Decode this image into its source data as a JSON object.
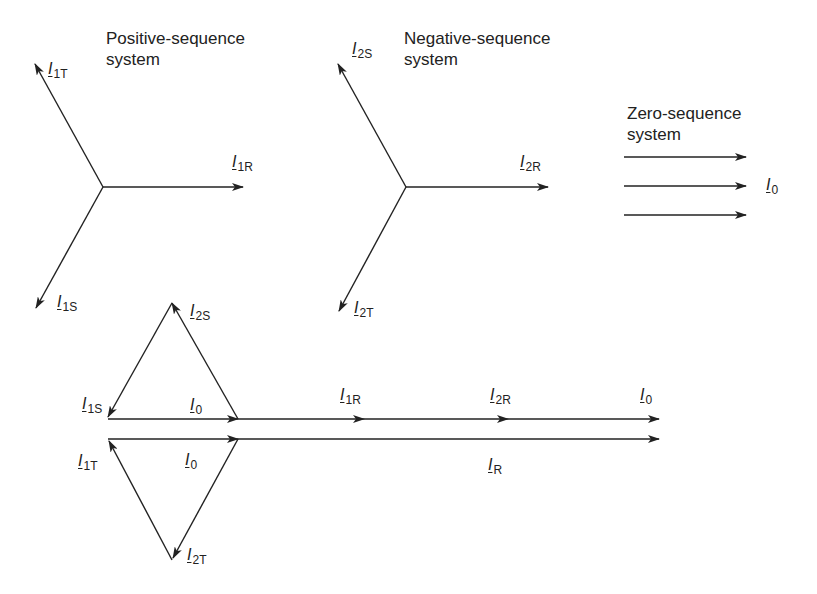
{
  "figure": {
    "captions": {
      "positive": "Positive-sequence\nsystem",
      "negative": "Negative-sequence\nsystem",
      "zero": "Zero-sequence\nsystem"
    },
    "positive_sequence": {
      "phasors": [
        {
          "id": "I1R",
          "symbol": "I",
          "subscript": "1R"
        },
        {
          "id": "I1S",
          "symbol": "I",
          "subscript": "1S"
        },
        {
          "id": "I1T",
          "symbol": "I",
          "subscript": "1T"
        }
      ]
    },
    "negative_sequence": {
      "phasors": [
        {
          "id": "I2R",
          "symbol": "I",
          "subscript": "2R"
        },
        {
          "id": "I2S",
          "symbol": "I",
          "subscript": "2S"
        },
        {
          "id": "I2T",
          "symbol": "I",
          "subscript": "2T"
        }
      ]
    },
    "zero_sequence": {
      "phasor": {
        "id": "I0",
        "symbol": "I",
        "subscript": "0"
      },
      "arrow_count": 3
    },
    "composite": {
      "upper_path_labels": [
        {
          "symbol": "I",
          "subscript": "1S"
        },
        {
          "symbol": "I",
          "subscript": "2S"
        },
        {
          "symbol": "I",
          "subscript": "0"
        },
        {
          "symbol": "I",
          "subscript": "1R"
        },
        {
          "symbol": "I",
          "subscript": "2R"
        },
        {
          "symbol": "I",
          "subscript": "0"
        }
      ],
      "lower_path_labels": [
        {
          "symbol": "I",
          "subscript": "1T"
        },
        {
          "symbol": "I",
          "subscript": "2T"
        },
        {
          "symbol": "I",
          "subscript": "0"
        }
      ],
      "resultant": {
        "symbol": "I",
        "subscript": "R"
      }
    },
    "colors": {
      "stroke": "#222222",
      "background": "#ffffff"
    }
  }
}
